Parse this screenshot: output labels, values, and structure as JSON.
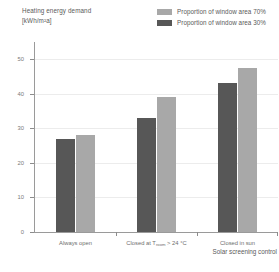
{
  "title": {
    "line1": "Heating energy demand",
    "line2": "[kWh/m²a]"
  },
  "legend": [
    {
      "label": "Proportion of window area 70%",
      "color": "#a8a8a8",
      "name": "legend-window-area-70"
    },
    {
      "label": "Proportion of window area 30%",
      "color": "#575757",
      "name": "legend-window-area-30"
    }
  ],
  "axis": {
    "y_ticks": [
      "0",
      "10",
      "20",
      "30",
      "40",
      "50"
    ],
    "x_caption": "Solar screening control"
  },
  "categories": [
    {
      "label": "Always open",
      "sub": "",
      "suffix": ""
    },
    {
      "label": "Closed at T",
      "sub": "room",
      "suffix": " > 24 °C"
    },
    {
      "label": "Closed in sun",
      "sub": "",
      "suffix": ""
    }
  ],
  "chart_data": {
    "type": "bar",
    "title": "Heating energy demand [kWh/m²a]",
    "xlabel": "Solar screening control",
    "ylabel": "Heating energy demand [kWh/m²a]",
    "ylim": [
      0,
      55
    ],
    "yticks": [
      0,
      10,
      20,
      30,
      40,
      50
    ],
    "grid": true,
    "legend_position": "top-right",
    "categories": [
      "Always open",
      "Closed at T_room > 24 °C",
      "Closed in sun"
    ],
    "series": [
      {
        "name": "Proportion of window area 30%",
        "color": "#575757",
        "values": [
          27,
          33,
          43
        ]
      },
      {
        "name": "Proportion of window area 70%",
        "color": "#a8a8a8",
        "values": [
          28,
          39,
          47.5
        ]
      }
    ]
  },
  "colors": {
    "dark": "#575757",
    "light": "#a8a8a8",
    "axis": "#9a9a9a",
    "grid": "#ececec",
    "text": "#5a5a5a"
  }
}
